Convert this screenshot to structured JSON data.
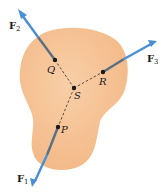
{
  "diagram": {
    "colors": {
      "body_fill": "#f6c59a",
      "body_edge": "#f0b483",
      "arrow": "#4a8fd6",
      "arrow_shadow": "#5a6f82",
      "point": "#1a1a1a",
      "dashed_line": "#3a2a20"
    },
    "points": [
      {
        "id": "Q",
        "label": "Q",
        "x": 55,
        "y": 60
      },
      {
        "id": "R",
        "label": "R",
        "x": 103,
        "y": 72
      },
      {
        "id": "S",
        "label": "S",
        "x": 74,
        "y": 88
      },
      {
        "id": "P",
        "label": "P",
        "x": 58,
        "y": 127
      }
    ],
    "forces": [
      {
        "id": "F1",
        "label": "F",
        "subscript": "1",
        "from": "P",
        "tip": [
          32,
          187
        ]
      },
      {
        "id": "F2",
        "label": "F",
        "subscript": "2",
        "from": "Q",
        "tip": [
          18,
          9
        ]
      },
      {
        "id": "F3",
        "label": "F",
        "subscript": "3",
        "from": "R",
        "tip": [
          157,
          41
        ]
      }
    ],
    "labels": {
      "F1_main": "F",
      "F1_sub": "1",
      "F2_main": "F",
      "F2_sub": "2",
      "F3_main": "F",
      "F3_sub": "3",
      "Q": "Q",
      "R": "R",
      "S": "S",
      "P": "P"
    }
  }
}
